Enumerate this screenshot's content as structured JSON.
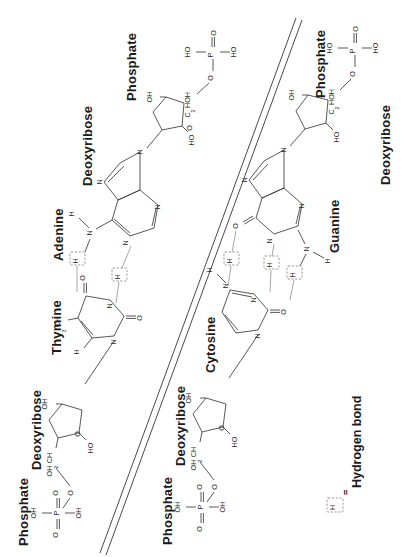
{
  "figure": {
    "orientation": "rotated-90",
    "background_color": "#ffffff",
    "line_color": "#3a3a3a",
    "hydrogen_bond_color": "#8f8f8f"
  },
  "labels": {
    "phosphate_top_left": "Phosphate",
    "deoxyribose_top_left": "Deoxyribose",
    "adenine": "Adenine",
    "thymine": "Thymine",
    "deoxyribose_bottom_left": "Deoxyribose",
    "phosphate_bottom_left": "Phosphate",
    "phosphate_top_right": "Phosphate",
    "deoxyribose_top_right": "Deoxyribose",
    "guanine": "Guanine",
    "cytosine": "Cytosine",
    "deoxyribose_bottom_right": "Deoxyribose",
    "phosphate_bottom_right": "Phosphate"
  },
  "legend": {
    "symbol": "H",
    "equals": "=",
    "text": "Hydrogen bond"
  },
  "atoms": {
    "O": "O",
    "N": "N",
    "H": "H",
    "P": "P",
    "HO": "HO",
    "OH": "OH",
    "HOH2C_main": "HOH",
    "HOH2C_sub": "2",
    "HOH2C_tail": "C",
    "CH2OH_main": "CH",
    "CH2OH_sub": "2",
    "CH2OH_tail": "OH",
    "CH3_main": "CH",
    "CH3_sub": "3"
  },
  "chain_left": {
    "strand": "left",
    "phosphate_formula": "HO-P(=O)(-OH)-O-",
    "sugar": "deoxyribose",
    "bases": [
      "Adenine",
      "Thymine"
    ]
  },
  "chain_right": {
    "strand": "right",
    "phosphate_formula": "HO-P(=O)(-OH)-O-",
    "sugar": "deoxyribose",
    "bases": [
      "Guanine",
      "Cytosine"
    ]
  },
  "base_pairs": [
    {
      "pair": "A-T",
      "hydrogen_bonds": 2
    },
    {
      "pair": "G-C",
      "hydrogen_bonds": 3
    }
  ]
}
